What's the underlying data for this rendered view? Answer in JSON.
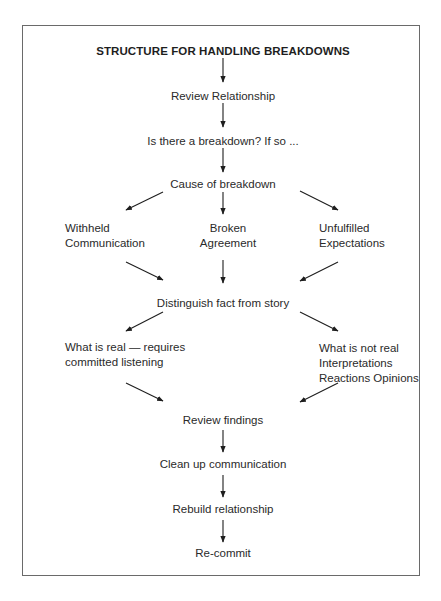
{
  "diagram": {
    "title": "STRUCTURE FOR HANDLING BREAKDOWNS",
    "steps": {
      "review_relationship": "Review Relationship",
      "is_breakdown": "Is there a breakdown? If so ...",
      "cause": "Cause of breakdown",
      "distinguish": "Distinguish fact from story",
      "review_findings": "Review findings",
      "clean_up": "Clean up communication",
      "rebuild": "Rebuild relationship",
      "recommit": "Re-commit"
    },
    "causes": {
      "withheld": {
        "line1": "Withheld",
        "line2": "Communication"
      },
      "broken": {
        "line1": "Broken",
        "line2": "Agreement"
      },
      "unfulfilled": {
        "line1": "Unfulfilled",
        "line2": "Expectations"
      }
    },
    "fact_story": {
      "real": {
        "line1": "What is real — requires",
        "line2": "committed listening"
      },
      "not_real": {
        "line1": "What is not real",
        "line2": "Interpretations",
        "line3": "Reactions Opinions"
      }
    },
    "colors": {
      "ink": "#2a2a2a",
      "frame": "#6a6a6a",
      "background": "#ffffff"
    }
  }
}
